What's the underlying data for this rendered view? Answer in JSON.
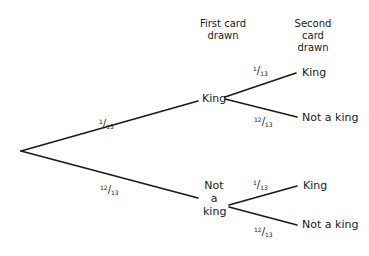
{
  "headers": {
    "first": [
      "First card",
      "drawn"
    ],
    "second": [
      "Second card",
      "drawn"
    ]
  },
  "tree": {
    "root": {
      "branches": [
        {
          "probability": {
            "num": "1",
            "den": "13"
          },
          "outcome": "King",
          "branches": [
            {
              "probability": {
                "num": "1",
                "den": "13"
              },
              "outcome": "King"
            },
            {
              "probability": {
                "num": "12",
                "den": "13"
              },
              "outcome": "Not a king"
            }
          ]
        },
        {
          "probability": {
            "num": "12",
            "den": "13"
          },
          "outcome_lines": [
            "Not",
            "a",
            "king"
          ],
          "branches": [
            {
              "probability": {
                "num": "1",
                "den": "13"
              },
              "outcome": "King"
            },
            {
              "probability": {
                "num": "12",
                "den": "13"
              },
              "outcome": "Not a king"
            }
          ]
        }
      ]
    }
  },
  "colors": {
    "line": "#1a1a1a",
    "background": "#ffffff"
  }
}
